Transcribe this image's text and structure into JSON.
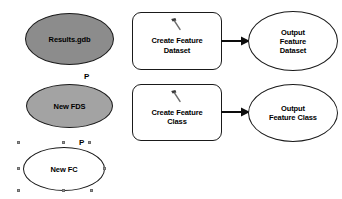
{
  "diagram": {
    "background_color": "#ffffff",
    "stroke_color": "#1a1a1a",
    "text_color": "#000000"
  },
  "data_elements": [
    {
      "id": "results-gdb",
      "label": "Results.gdb",
      "shape": "ellipse",
      "fill": "#8c8c8c",
      "parameter": false,
      "selected": false
    },
    {
      "id": "new-fds",
      "label": "New FDS",
      "shape": "ellipse",
      "fill": "#a3a3a3",
      "parameter": true,
      "parameter_flag": "P",
      "selected": false
    },
    {
      "id": "new-fc",
      "label": "New FC",
      "shape": "ellipse",
      "fill": "#ffffff",
      "parameter": true,
      "parameter_flag": "P",
      "selected": true
    }
  ],
  "processes": [
    {
      "id": "create-feature-dataset",
      "tool_label": "Create Feature\nDataset",
      "icon": "hammer-tool-icon",
      "output": {
        "id": "output-feature-dataset",
        "label": "Output\nFeature\nDataset",
        "fill": "#ffffff"
      }
    },
    {
      "id": "create-feature-class",
      "tool_label": "Create Feature\nClass",
      "icon": "hammer-tool-icon",
      "output": {
        "id": "output-feature-class",
        "label": "Output\nFeature Class",
        "fill": "#ffffff"
      }
    }
  ],
  "selection": {
    "handle_fill": "#9a9a9a",
    "handle_border": "#6b6b6b",
    "handle_count": 8
  }
}
